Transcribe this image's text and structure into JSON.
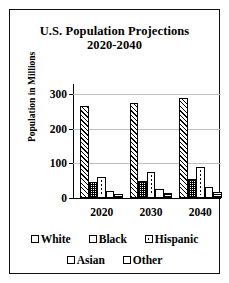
{
  "chart_data": {
    "type": "bar",
    "title": "U.S. Population Projections 2020-2040",
    "title_line1": "U.S. Population Projections",
    "title_line2": "2020-2040",
    "xlabel": "",
    "ylabel": "Population in Millions",
    "categories": [
      "2020",
      "2030",
      "2040"
    ],
    "yticks": [
      0,
      100,
      200,
      300
    ],
    "ytick_labels": [
      "0",
      "100",
      "200",
      "300"
    ],
    "ylim": [
      0,
      330
    ],
    "grid": true,
    "legend_position": "bottom",
    "series": [
      {
        "name": "White",
        "pattern": "diagonal-hatch",
        "values": [
          266,
          276,
          289
        ]
      },
      {
        "name": "Black",
        "pattern": "checkered",
        "values": [
          45,
          50,
          56
        ]
      },
      {
        "name": "Hispanic",
        "pattern": "dashed-center",
        "values": [
          62,
          75,
          89
        ]
      },
      {
        "name": "Asian",
        "pattern": "solid-white",
        "values": [
          20,
          26,
          32
        ]
      },
      {
        "name": "Other",
        "pattern": "horizontal-line",
        "values": [
          12,
          15,
          18
        ]
      }
    ]
  },
  "legend": {
    "rows": [
      [
        "White",
        "Black",
        "Hispanic"
      ],
      [
        "Asian",
        "Other"
      ]
    ]
  }
}
